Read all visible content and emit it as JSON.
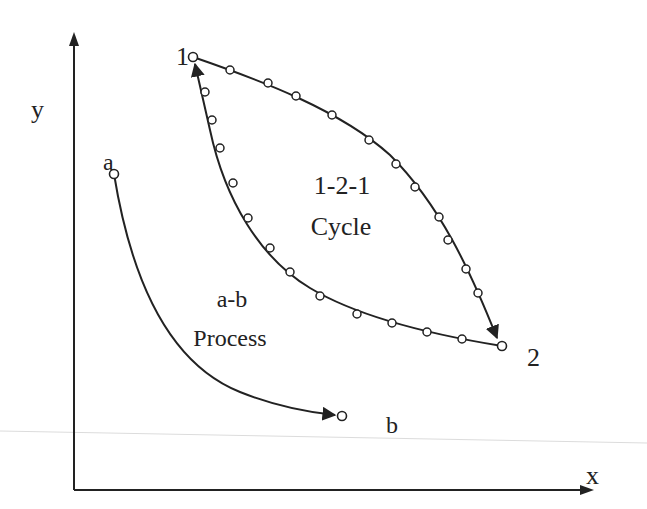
{
  "diagram": {
    "type": "thermodynamic-process-diagram",
    "axes": {
      "x_label": "x",
      "y_label": "y"
    },
    "points": {
      "a": {
        "label": "a"
      },
      "b": {
        "label": "b"
      },
      "p1": {
        "label": "1"
      },
      "p2": {
        "label": "2"
      }
    },
    "process": {
      "line1": "a-b",
      "line2": "Process"
    },
    "cycle": {
      "line1": "1-2-1",
      "line2": "Cycle"
    },
    "colors": {
      "stroke": "#222222",
      "marker_fill": "#ffffff",
      "guide_line": "#d8d8d8"
    }
  }
}
